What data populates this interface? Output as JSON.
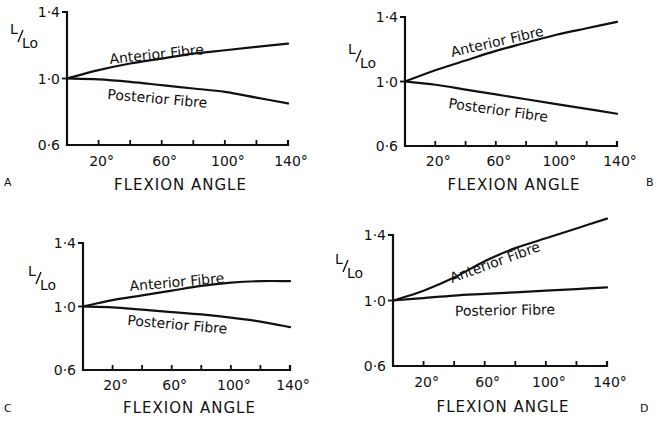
{
  "figure": {
    "panels": [
      {
        "letter": "A",
        "letter_pos": [
          4,
          186
        ]
      },
      {
        "letter": "B",
        "letter_pos": [
          646,
          186
        ]
      },
      {
        "letter": "C",
        "letter_pos": [
          4,
          412
        ]
      },
      {
        "letter": "D",
        "letter_pos": [
          640,
          412
        ]
      }
    ]
  },
  "chart_data": [
    {
      "panel": "A",
      "type": "line",
      "xlabel": "FLEXION ANGLE",
      "ylabel": "L/Lo",
      "ylim": [
        0.6,
        1.4
      ],
      "xlim": [
        0,
        140
      ],
      "y_ticks": [
        "0·6",
        "1·0",
        "1·4"
      ],
      "x_tick_labels": [
        "20°",
        "60°",
        "100°",
        "140°"
      ],
      "x_tick_positions": [
        20,
        40,
        60,
        80,
        100,
        120,
        140
      ],
      "grid": false,
      "series": [
        {
          "name": "Anterior Fibre",
          "x": [
            0,
            20,
            40,
            60,
            80,
            100,
            120,
            140
          ],
          "y": [
            1.0,
            1.05,
            1.09,
            1.12,
            1.15,
            1.17,
            1.19,
            1.21
          ]
        },
        {
          "name": "Posterior Fibre",
          "x": [
            0,
            20,
            40,
            60,
            80,
            100,
            120,
            140
          ],
          "y": [
            1.0,
            0.995,
            0.98,
            0.96,
            0.94,
            0.92,
            0.885,
            0.85
          ]
        }
      ]
    },
    {
      "panel": "B",
      "type": "line",
      "xlabel": "FLEXION ANGLE",
      "ylabel": "L/Lo",
      "ylim": [
        0.6,
        1.4
      ],
      "xlim": [
        0,
        140
      ],
      "y_ticks": [
        "0·6",
        "1·0",
        "1·4"
      ],
      "x_tick_labels": [
        "20°",
        "60°",
        "100°",
        "140°"
      ],
      "x_tick_positions": [
        20,
        40,
        60,
        80,
        100,
        120,
        140
      ],
      "grid": false,
      "series": [
        {
          "name": "Anterior Fibre",
          "x": [
            0,
            20,
            40,
            60,
            80,
            100,
            120,
            140
          ],
          "y": [
            1.0,
            1.07,
            1.13,
            1.19,
            1.24,
            1.29,
            1.33,
            1.37
          ]
        },
        {
          "name": "Posterior Fibre",
          "x": [
            0,
            20,
            40,
            60,
            80,
            100,
            120,
            140
          ],
          "y": [
            1.0,
            0.98,
            0.95,
            0.92,
            0.89,
            0.86,
            0.83,
            0.8
          ]
        }
      ]
    },
    {
      "panel": "C",
      "type": "line",
      "xlabel": "FLEXION ANGLE",
      "ylabel": "L/Lo",
      "ylim": [
        0.6,
        1.4
      ],
      "xlim": [
        0,
        140
      ],
      "y_ticks": [
        "0·6",
        "1·0",
        "1·4"
      ],
      "x_tick_labels": [
        "20°",
        "60°",
        "100°",
        "140°"
      ],
      "x_tick_positions": [
        20,
        40,
        60,
        80,
        100,
        120,
        140
      ],
      "grid": false,
      "series": [
        {
          "name": "Anterior Fibre",
          "x": [
            0,
            20,
            40,
            60,
            80,
            100,
            120,
            140
          ],
          "y": [
            1.0,
            1.04,
            1.07,
            1.1,
            1.13,
            1.15,
            1.16,
            1.16
          ]
        },
        {
          "name": "Posterior Fibre",
          "x": [
            0,
            20,
            40,
            60,
            80,
            100,
            120,
            140
          ],
          "y": [
            1.0,
            0.995,
            0.98,
            0.965,
            0.95,
            0.93,
            0.905,
            0.87
          ]
        }
      ]
    },
    {
      "panel": "D",
      "type": "line",
      "xlabel": "FLEXION ANGLE",
      "ylabel": "L/Lo",
      "ylim": [
        0.6,
        1.4
      ],
      "xlim": [
        0,
        140
      ],
      "y_ticks": [
        "0·6",
        "1·0",
        "1·4"
      ],
      "x_tick_labels": [
        "20°",
        "60°",
        "100°",
        "140°"
      ],
      "x_tick_positions": [
        20,
        40,
        60,
        80,
        100,
        120,
        140
      ],
      "grid": false,
      "series": [
        {
          "name": "Anterior Fibre",
          "x": [
            0,
            20,
            40,
            60,
            80,
            100,
            120,
            140
          ],
          "y": [
            1.0,
            1.06,
            1.14,
            1.24,
            1.32,
            1.38,
            1.44,
            1.5
          ]
        },
        {
          "name": "Posterior Fibre",
          "x": [
            0,
            20,
            40,
            60,
            80,
            100,
            120,
            140
          ],
          "y": [
            1.0,
            1.015,
            1.03,
            1.04,
            1.05,
            1.06,
            1.07,
            1.08
          ]
        }
      ]
    }
  ],
  "layout": {
    "panels": [
      {
        "x0": 67,
        "x1": 288,
        "y_top": 12,
        "y_bottom": 145,
        "ylab_x": 62,
        "curve_labels": [
          {
            "text_index": 0,
            "x": 110,
            "y": 64,
            "rot": -6
          },
          {
            "text_index": 1,
            "x": 107,
            "y": 99,
            "rot": 5
          }
        ],
        "ytitle": [
          10,
          38
        ],
        "xlab_y": 166,
        "xtitle_y": 190
      },
      {
        "x0": 405,
        "x1": 617,
        "y_top": 17,
        "y_bottom": 146,
        "ylab_x": 400,
        "curve_labels": [
          {
            "text_index": 0,
            "x": 452,
            "y": 57,
            "rot": -13
          },
          {
            "text_index": 1,
            "x": 448,
            "y": 108,
            "rot": 8
          }
        ],
        "ytitle": [
          348,
          58
        ],
        "xlab_y": 166,
        "xtitle_y": 190
      },
      {
        "x0": 83,
        "x1": 290,
        "y_top": 243,
        "y_bottom": 370,
        "ylab_x": 78,
        "curve_labels": [
          {
            "text_index": 0,
            "x": 130,
            "y": 291,
            "rot": -5
          },
          {
            "text_index": 1,
            "x": 127,
            "y": 325,
            "rot": 5
          }
        ],
        "ytitle": [
          28,
          280
        ],
        "xlab_y": 390,
        "xtitle_y": 413
      },
      {
        "x0": 393,
        "x1": 607,
        "y_top": 235,
        "y_bottom": 366,
        "ylab_x": 388,
        "curve_labels": [
          {
            "text_index": 0,
            "x": 452,
            "y": 283,
            "rot": -20
          },
          {
            "text_index": 1,
            "x": 455,
            "y": 316,
            "rot": -1
          }
        ],
        "ytitle": [
          335,
          268
        ],
        "xlab_y": 387,
        "xtitle_y": 412
      }
    ]
  }
}
